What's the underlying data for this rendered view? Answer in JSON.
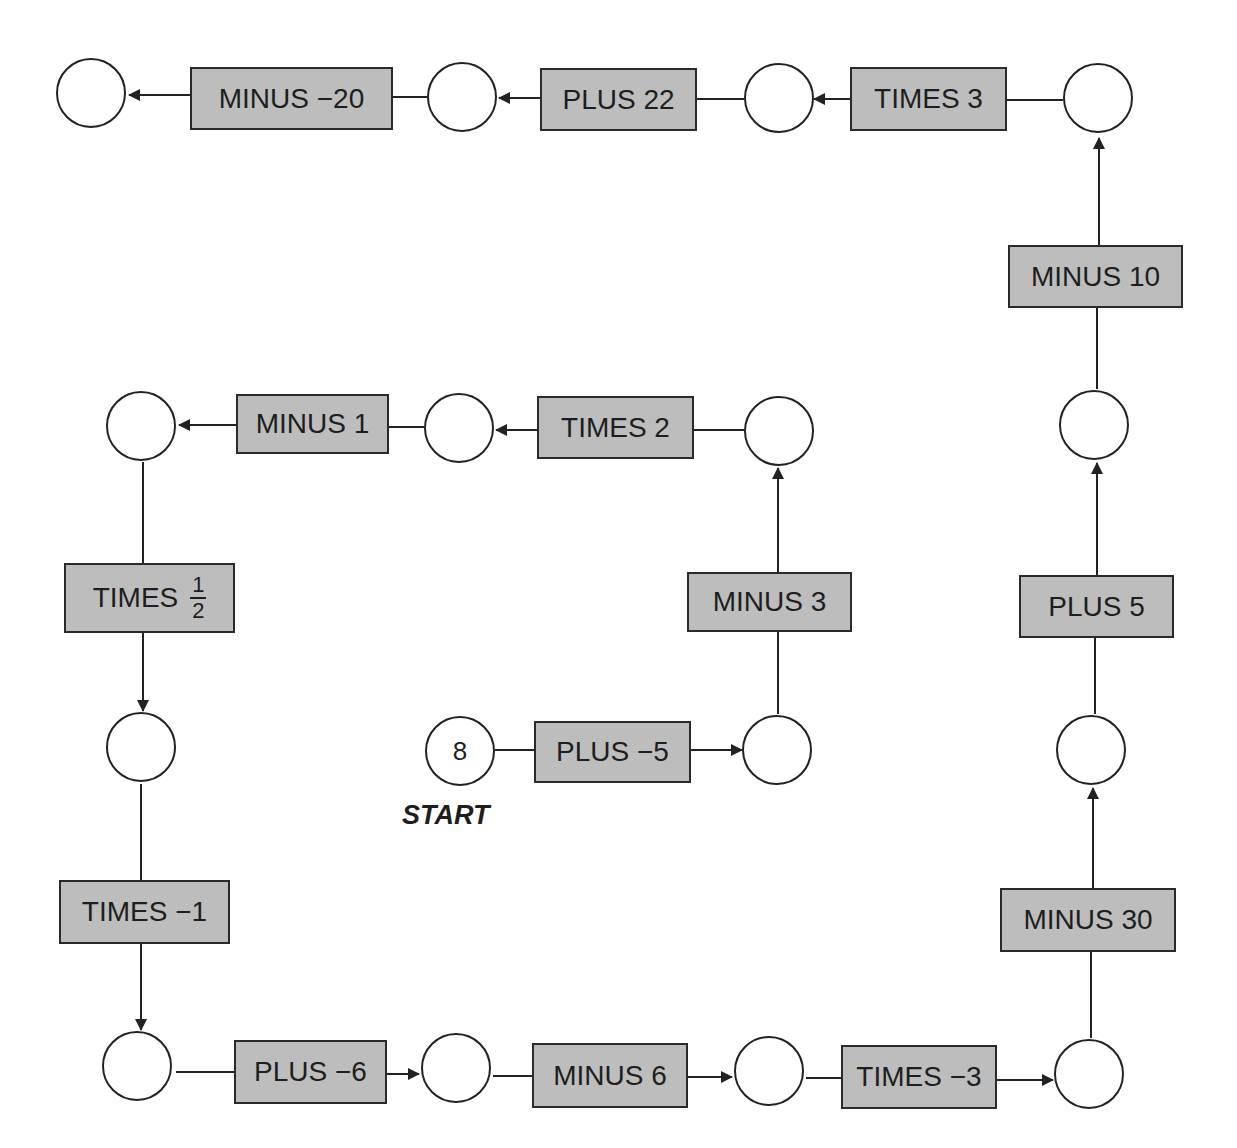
{
  "start": {
    "label": "START",
    "value": "8"
  },
  "operations": [
    {
      "id": "op1",
      "text": "PLUS −5"
    },
    {
      "id": "op2",
      "text": "MINUS 3"
    },
    {
      "id": "op3",
      "text": "TIMES 2"
    },
    {
      "id": "op4",
      "text": "MINUS 1"
    },
    {
      "id": "op5",
      "text": "TIMES",
      "fraction": {
        "numerator": "1",
        "denominator": "2"
      }
    },
    {
      "id": "op6",
      "text": "TIMES −1"
    },
    {
      "id": "op7",
      "text": "PLUS −6"
    },
    {
      "id": "op8",
      "text": "MINUS 6"
    },
    {
      "id": "op9",
      "text": "TIMES −3"
    },
    {
      "id": "op10",
      "text": "MINUS 30"
    },
    {
      "id": "op11",
      "text": "PLUS 5"
    },
    {
      "id": "op12",
      "text": "MINUS 10"
    },
    {
      "id": "op13",
      "text": "TIMES 3"
    },
    {
      "id": "op14",
      "text": "PLUS 22"
    },
    {
      "id": "op15",
      "text": "MINUS −20"
    }
  ],
  "nodes": [
    "8",
    "",
    "",
    "",
    "",
    "",
    "",
    "",
    "",
    "",
    "",
    "",
    "",
    "",
    "",
    ""
  ],
  "colors": {
    "box_fill": "#bdbdbd",
    "stroke": "#222222",
    "background": "#ffffff"
  }
}
